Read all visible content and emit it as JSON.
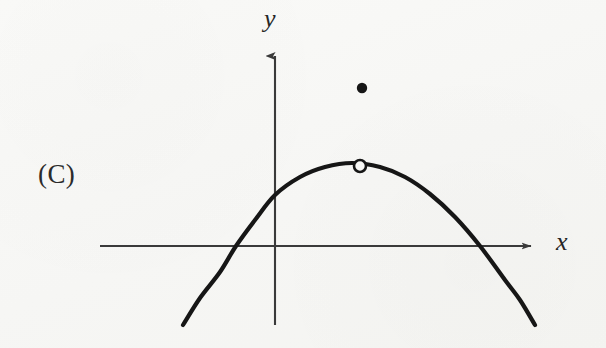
{
  "figure": {
    "choice_label": "(C)",
    "background_color": "#f8f8f6",
    "ink_color": "#1c1c1c",
    "axis_color": "#3a3a3a"
  },
  "axes": {
    "x_label": "x",
    "y_label": "y",
    "x_axis": {
      "x_start": 100,
      "x_end": 537,
      "y": 246,
      "arrow": "right"
    },
    "y_axis": {
      "x": 275,
      "y_top": 50,
      "y_bottom": 325,
      "arrow": "up"
    }
  },
  "chart_data": {
    "type": "line",
    "title": "",
    "subtitle": "",
    "xlabel": "x",
    "ylabel": "y",
    "grid": false,
    "legend": "none",
    "xlim": [
      183,
      535
    ],
    "ylim": [
      325,
      50
    ],
    "series": [
      {
        "name": "parabola",
        "shape": "downward parabola",
        "stroke": "#161616",
        "stroke_width": 4.2,
        "vertex_px": [
          352,
          163
        ],
        "roots_px": [
          236,
          480
        ],
        "y_intercept_px": [
          275,
          195
        ],
        "endpoints_px": [
          [
            183,
            325
          ],
          [
            535,
            325
          ]
        ],
        "points_px": [
          [
            183,
            325
          ],
          [
            200,
            298
          ],
          [
            220,
            272
          ],
          [
            236,
            246
          ],
          [
            255,
            220
          ],
          [
            275,
            195
          ],
          [
            300,
            177
          ],
          [
            325,
            167
          ],
          [
            352,
            163
          ],
          [
            380,
            167
          ],
          [
            405,
            177
          ],
          [
            430,
            194
          ],
          [
            455,
            217
          ],
          [
            480,
            246
          ],
          [
            505,
            280
          ],
          [
            520,
            300
          ],
          [
            535,
            325
          ]
        ]
      }
    ],
    "annotations": [
      {
        "name": "open-point-at-vertex",
        "marker": "open-circle",
        "cx": 360,
        "cy": 166,
        "r": 6,
        "fill": "#f8f8f6",
        "stroke": "#161616",
        "stroke_width": 2.6,
        "meaning": "removable discontinuity at the vertex"
      },
      {
        "name": "filled-point-above",
        "marker": "filled-circle",
        "cx": 362,
        "cy": 88,
        "r": 5.2,
        "fill": "#161616",
        "stroke": "none",
        "meaning": "isolated function value above the vertex"
      }
    ]
  }
}
